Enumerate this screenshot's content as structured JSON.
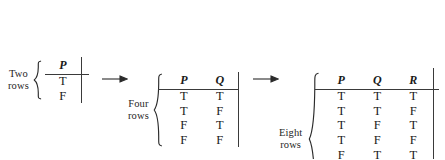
{
  "figure": {
    "kind": "truth-table-expansion-diagram",
    "stages": [
      {
        "id": "two",
        "caption_line1": "Two",
        "caption_line2": "rows",
        "headers": [
          "P"
        ],
        "header_bold": [
          false
        ],
        "rows": [
          [
            "T"
          ],
          [
            "F"
          ]
        ],
        "bold_columns": []
      },
      {
        "id": "four",
        "caption_line1": "Four",
        "caption_line2": "rows",
        "headers": [
          "P",
          "Q"
        ],
        "header_bold": [
          false,
          false
        ],
        "rows": [
          [
            "T",
            "T"
          ],
          [
            "T",
            "F"
          ],
          [
            "F",
            "T"
          ],
          [
            "F",
            "F"
          ]
        ],
        "bold_columns": [
          1
        ]
      },
      {
        "id": "eight",
        "caption_line1": "Eight",
        "caption_line2": "rows",
        "headers": [
          "P",
          "Q",
          "R"
        ],
        "header_bold": [
          false,
          false,
          false
        ],
        "rows": [
          [
            "T",
            "T",
            "T"
          ],
          [
            "T",
            "T",
            "F"
          ],
          [
            "T",
            "F",
            "T"
          ],
          [
            "T",
            "F",
            "F"
          ],
          [
            "F",
            "T",
            "T"
          ],
          [
            "F",
            "T",
            "F"
          ],
          [
            "F",
            "F",
            "T"
          ],
          [
            "F",
            "F",
            "F"
          ]
        ],
        "bold_columns": [
          1,
          2
        ]
      }
    ],
    "arrows": [
      "→",
      "→"
    ],
    "colors": {
      "ink": "#1a1a1a",
      "rule": "#3a3a3a",
      "background": "#ffffff"
    }
  }
}
